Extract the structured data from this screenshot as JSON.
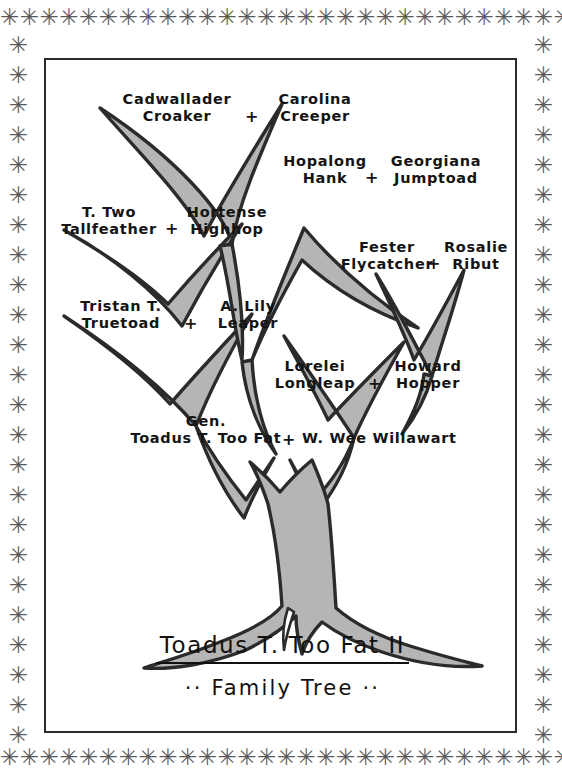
{
  "document": {
    "kind": "hand-drawn family tree illustration",
    "border_motif_glyph": "✳",
    "border_motif_repeat_count_horizontal": 31,
    "border_motif_repeat_count_vertical": 24
  },
  "title": {
    "main": "Toadus T. Too Fat II",
    "subtitle": "·· Family Tree ··"
  },
  "colors": {
    "ink": "#141414",
    "branch_outline": "#2b2b2b",
    "branch_fill": "#b5b5b5",
    "border": "#5a5a5a",
    "paper": "#ffffff"
  },
  "couples": [
    {
      "id": "couple-cadwallader-carolina",
      "generation": 1,
      "left": {
        "line1": "Cadwallader",
        "line2": "Croaker"
      },
      "joiner": "+",
      "right": {
        "line1": "Carolina",
        "line2": "Creeper"
      }
    },
    {
      "id": "couple-hopalong-georgiana",
      "generation": 1,
      "left": {
        "line1": "Hopalong",
        "line2": "Hank"
      },
      "joiner": "+",
      "right": {
        "line1": "Georgiana",
        "line2": "Jumptoad"
      }
    },
    {
      "id": "couple-ttwo-hortense",
      "generation": 2,
      "left": {
        "line1": "T. Two",
        "line2": "Tallfeather"
      },
      "joiner": "+",
      "right": {
        "line1": "Hortense",
        "line2": "Highhop"
      }
    },
    {
      "id": "couple-fester-rosalie",
      "generation": 2,
      "left": {
        "line1": "Fester",
        "line2": "Flycatcher"
      },
      "joiner": "+",
      "right": {
        "line1": "Rosalie",
        "line2": "Ribut"
      }
    },
    {
      "id": "couple-tristan-alily",
      "generation": 3,
      "left": {
        "line1": "Tristan T.",
        "line2": "Truetoad"
      },
      "joiner": "+",
      "right": {
        "line1": "A. Lily",
        "line2": "Leaper"
      }
    },
    {
      "id": "couple-lorelei-howard",
      "generation": 3,
      "left": {
        "line1": "Lorelei",
        "line2": "Longleap"
      },
      "joiner": "+",
      "right": {
        "line1": "Howard",
        "line2": "Hopper"
      }
    },
    {
      "id": "couple-toadus-wee",
      "generation": 4,
      "left": {
        "line1": "Gen.",
        "line2": "Toadus T. Too Fat"
      },
      "joiner": "+",
      "right": {
        "line1": "",
        "line2": "W. Wee Willawart"
      }
    }
  ]
}
